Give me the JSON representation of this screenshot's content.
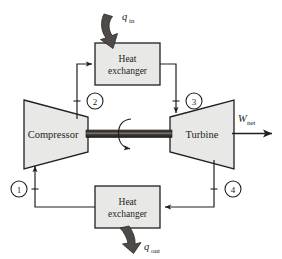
{
  "diagram": {
    "colors": {
      "stroke": "#231f20",
      "component_fill": "#e8e8e6",
      "shaft_dark": "#2b2724",
      "shaft_light": "#6e6761",
      "arrow_fill": "#4d4a47",
      "background": "#ffffff"
    },
    "components": [
      {
        "id": "compressor",
        "label": "Compressor",
        "shape": "trapezoid-left"
      },
      {
        "id": "turbine",
        "label": "Turbine",
        "shape": "trapezoid-right"
      },
      {
        "id": "heat-exchanger-top",
        "label_line1": "Heat",
        "label_line2": "exchanger",
        "shape": "rectangle"
      },
      {
        "id": "heat-exchanger-bottom",
        "label_line1": "Heat",
        "label_line2": "exchanger",
        "shape": "rectangle"
      },
      {
        "id": "shaft",
        "label": "",
        "shape": "bar"
      }
    ],
    "state_points": [
      {
        "id": "state-1",
        "label": "1"
      },
      {
        "id": "state-2",
        "label": "2"
      },
      {
        "id": "state-3",
        "label": "3"
      },
      {
        "id": "state-4",
        "label": "4"
      }
    ],
    "energy_flows": [
      {
        "id": "heat-in",
        "symbol": "q",
        "subscript": "in",
        "direction": "into-top-heat-exchanger"
      },
      {
        "id": "heat-out",
        "symbol": "q",
        "subscript": "out",
        "direction": "out-of-bottom-heat-exchanger"
      },
      {
        "id": "work-net",
        "symbol": "W",
        "subscript": "net",
        "direction": "out-of-turbine-right"
      }
    ],
    "rotation_indicator": {
      "id": "shaft-rotation-arrow",
      "label": ""
    }
  }
}
